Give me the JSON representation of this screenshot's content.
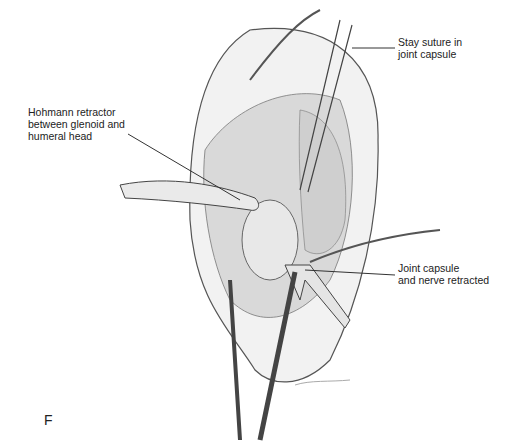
{
  "figure": {
    "panel_letter": "F",
    "signature": "signature",
    "labels": [
      {
        "id": "stay-suture",
        "text": "Stay suture in\njoint capsule"
      },
      {
        "id": "hohmann-retractor",
        "text": "Hohmann retractor\nbetween glenoid and\nhumeral head"
      },
      {
        "id": "joint-capsule-retracted",
        "text": "Joint capsule\nand nerve retracted"
      }
    ]
  }
}
